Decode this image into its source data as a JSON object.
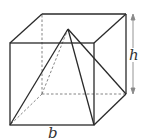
{
  "figure": {
    "labels": {
      "height": "h",
      "base": "b"
    },
    "colors": {
      "line": "#2a2a2a",
      "dashed": "#777777",
      "arrow": "#888888",
      "label": "#333333"
    }
  }
}
